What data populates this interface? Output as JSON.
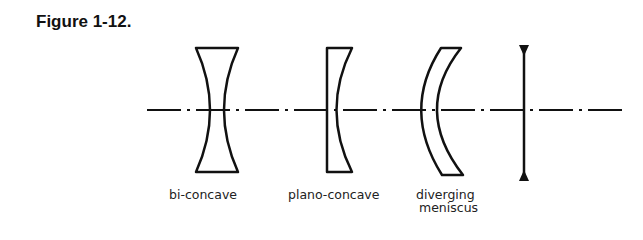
{
  "figure": {
    "title": "Figure 1-12.",
    "lenses": [
      {
        "name": "bi-concave",
        "label_lines": [
          "bi-concave"
        ]
      },
      {
        "name": "plano-concave",
        "label_lines": [
          "plano-concave"
        ]
      },
      {
        "name": "diverging-meniscus",
        "label_lines": [
          "diverging",
          "meniscus"
        ]
      },
      {
        "name": "thin-lens-symbol",
        "label_lines": []
      }
    ],
    "colors": {
      "stroke": "#111111",
      "background": "#ffffff"
    }
  }
}
